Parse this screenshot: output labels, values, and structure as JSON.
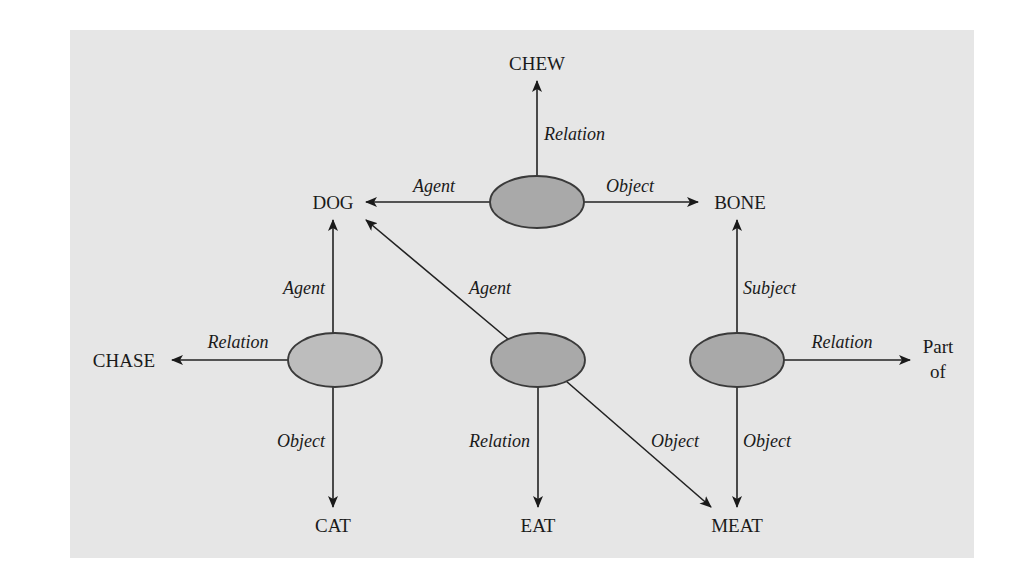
{
  "diagram": {
    "background": "#e6e6e6",
    "ellipse_fill_dark": "#a9a9a9",
    "ellipse_fill_light": "#bdbdbd",
    "propositions": [
      {
        "id": "p1",
        "cx": 537,
        "cy": 202,
        "fill": "dark"
      },
      {
        "id": "p2",
        "cx": 335,
        "cy": 360,
        "fill": "light"
      },
      {
        "id": "p3",
        "cx": 538,
        "cy": 360,
        "fill": "dark"
      },
      {
        "id": "p4",
        "cx": 737,
        "cy": 360,
        "fill": "dark"
      }
    ],
    "nodes": {
      "chew": "CHEW",
      "dog": "DOG",
      "bone": "BONE",
      "chase": "CHASE",
      "cat": "CAT",
      "eat": "EAT",
      "meat": "MEAT",
      "part_of_line1": "Part",
      "part_of_line2": "of"
    },
    "edges": {
      "p1_relation": "Relation",
      "p1_agent": "Agent",
      "p1_object": "Object",
      "p2_agent": "Agent",
      "p2_relation": "Relation",
      "p2_object": "Object",
      "p3_agent": "Agent",
      "p3_relation": "Relation",
      "p3_object": "Object",
      "p4_subject": "Subject",
      "p4_relation": "Relation",
      "p4_object": "Object"
    }
  }
}
